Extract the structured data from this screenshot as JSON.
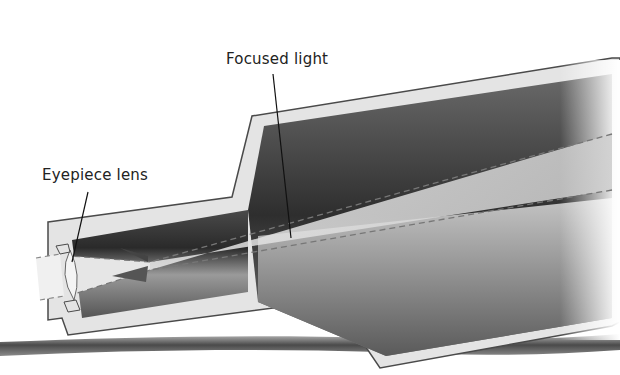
{
  "diagram": {
    "type": "telescope cross-section",
    "labels": {
      "focused_light": "Focused light",
      "eyepiece_lens": "Eyepiece lens"
    },
    "colors": {
      "background": "#ffffff",
      "shell": "#e4e4e4",
      "outline": "#4a4a4a",
      "tube_dark": "#3a3a3a",
      "tube_mid": "#8a8a8a",
      "light_beam": "#d8d8d8",
      "ground": "#5a5a5a"
    }
  }
}
